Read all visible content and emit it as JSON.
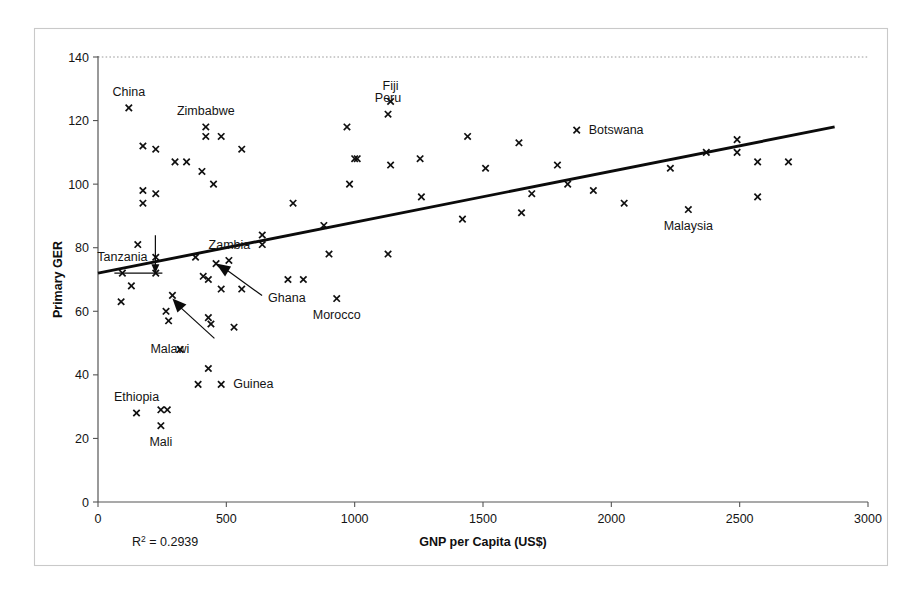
{
  "chart_data": {
    "type": "scatter",
    "title": "",
    "xlabel": "GNP per Capita (US$)",
    "ylabel": "Primary GER",
    "xlim": [
      0,
      3000
    ],
    "ylim": [
      0,
      140
    ],
    "xticks": [
      0,
      500,
      1000,
      1500,
      2000,
      2500,
      3000
    ],
    "yticks": [
      0,
      20,
      40,
      60,
      80,
      100,
      120,
      140
    ],
    "grid": false,
    "legend": null,
    "annotations": {
      "r2_prefix": "R",
      "r2_exponent": "2",
      "r2_value": " = 0.2939"
    },
    "trendline": {
      "type": "linear",
      "x_start": 0,
      "y_start": 72,
      "x_end": 2870,
      "y_end": 118
    },
    "marker_symbol": "x",
    "series": [
      {
        "name": "Countries",
        "points": [
          {
            "x": 120,
            "y": 124,
            "label": "China",
            "label_pos": "above"
          },
          {
            "x": 175,
            "y": 112,
            "label": "",
            "label_pos": ""
          },
          {
            "x": 225,
            "y": 111,
            "label": "",
            "label_pos": ""
          },
          {
            "x": 300,
            "y": 107,
            "label": "",
            "label_pos": ""
          },
          {
            "x": 345,
            "y": 107,
            "label": "",
            "label_pos": ""
          },
          {
            "x": 420,
            "y": 115,
            "label": "",
            "label_pos": ""
          },
          {
            "x": 480,
            "y": 115,
            "label": "",
            "label_pos": ""
          },
          {
            "x": 405,
            "y": 104,
            "label": "",
            "label_pos": ""
          },
          {
            "x": 450,
            "y": 100,
            "label": "",
            "label_pos": ""
          },
          {
            "x": 560,
            "y": 111,
            "label": "",
            "label_pos": ""
          },
          {
            "x": 175,
            "y": 98,
            "label": "",
            "label_pos": ""
          },
          {
            "x": 225,
            "y": 97,
            "label": "",
            "label_pos": ""
          },
          {
            "x": 175,
            "y": 94,
            "label": "",
            "label_pos": ""
          },
          {
            "x": 1140,
            "y": 126,
            "label": "Fiji",
            "label_pos": "above"
          },
          {
            "x": 1865,
            "y": 117,
            "label": "Botswana",
            "label_pos": "right"
          },
          {
            "x": 1130,
            "y": 122,
            "label": "Peru",
            "label_pos": "above"
          },
          {
            "x": 420,
            "y": 118,
            "label": "Zimbabwe",
            "label_pos": "above"
          },
          {
            "x": 970,
            "y": 118,
            "label": "",
            "label_pos": ""
          },
          {
            "x": 1440,
            "y": 115,
            "label": "",
            "label_pos": ""
          },
          {
            "x": 1640,
            "y": 113,
            "label": "",
            "label_pos": ""
          },
          {
            "x": 1000,
            "y": 108,
            "label": "",
            "label_pos": ""
          },
          {
            "x": 1010,
            "y": 108,
            "label": "",
            "label_pos": ""
          },
          {
            "x": 1140,
            "y": 106,
            "label": "",
            "label_pos": ""
          },
          {
            "x": 1255,
            "y": 108,
            "label": "",
            "label_pos": ""
          },
          {
            "x": 1510,
            "y": 105,
            "label": "",
            "label_pos": ""
          },
          {
            "x": 1790,
            "y": 106,
            "label": "",
            "label_pos": ""
          },
          {
            "x": 2230,
            "y": 105,
            "label": "",
            "label_pos": ""
          },
          {
            "x": 2370,
            "y": 110,
            "label": "",
            "label_pos": ""
          },
          {
            "x": 2490,
            "y": 114,
            "label": "",
            "label_pos": ""
          },
          {
            "x": 2490,
            "y": 110,
            "label": "",
            "label_pos": ""
          },
          {
            "x": 2570,
            "y": 107,
            "label": "",
            "label_pos": ""
          },
          {
            "x": 2690,
            "y": 107,
            "label": "",
            "label_pos": ""
          },
          {
            "x": 2570,
            "y": 96,
            "label": "",
            "label_pos": ""
          },
          {
            "x": 2300,
            "y": 92,
            "label": "Malaysia",
            "label_pos": "below"
          },
          {
            "x": 2050,
            "y": 94,
            "label": "",
            "label_pos": ""
          },
          {
            "x": 1930,
            "y": 98,
            "label": "",
            "label_pos": ""
          },
          {
            "x": 1830,
            "y": 100,
            "label": "",
            "label_pos": ""
          },
          {
            "x": 1690,
            "y": 97,
            "label": "",
            "label_pos": ""
          },
          {
            "x": 1650,
            "y": 91,
            "label": "",
            "label_pos": ""
          },
          {
            "x": 1420,
            "y": 89,
            "label": "",
            "label_pos": ""
          },
          {
            "x": 1260,
            "y": 96,
            "label": "",
            "label_pos": ""
          },
          {
            "x": 980,
            "y": 100,
            "label": "",
            "label_pos": ""
          },
          {
            "x": 760,
            "y": 94,
            "label": "",
            "label_pos": ""
          },
          {
            "x": 640,
            "y": 84,
            "label": "",
            "label_pos": ""
          },
          {
            "x": 880,
            "y": 87,
            "label": "",
            "label_pos": ""
          },
          {
            "x": 1130,
            "y": 78,
            "label": "",
            "label_pos": ""
          },
          {
            "x": 900,
            "y": 78,
            "label": "",
            "label_pos": ""
          },
          {
            "x": 640,
            "y": 81,
            "label": "Zambia",
            "label_pos": "left"
          },
          {
            "x": 155,
            "y": 81,
            "label": "",
            "label_pos": ""
          },
          {
            "x": 225,
            "y": 77,
            "label": "",
            "label_pos": ""
          },
          {
            "x": 380,
            "y": 77,
            "label": "",
            "label_pos": ""
          },
          {
            "x": 510,
            "y": 76,
            "label": "",
            "label_pos": ""
          },
          {
            "x": 95,
            "y": 72,
            "label": "Tanzania",
            "label_pos": "above"
          },
          {
            "x": 225,
            "y": 72,
            "label": "",
            "label_pos": ""
          },
          {
            "x": 410,
            "y": 71,
            "label": "",
            "label_pos": ""
          },
          {
            "x": 430,
            "y": 70,
            "label": "",
            "label_pos": ""
          },
          {
            "x": 460,
            "y": 75,
            "label": "Ghana",
            "label_pos": "arrow"
          },
          {
            "x": 740,
            "y": 70,
            "label": "",
            "label_pos": ""
          },
          {
            "x": 800,
            "y": 70,
            "label": "",
            "label_pos": ""
          },
          {
            "x": 130,
            "y": 68,
            "label": "",
            "label_pos": ""
          },
          {
            "x": 480,
            "y": 67,
            "label": "",
            "label_pos": ""
          },
          {
            "x": 560,
            "y": 67,
            "label": "",
            "label_pos": ""
          },
          {
            "x": 90,
            "y": 63,
            "label": "",
            "label_pos": ""
          },
          {
            "x": 290,
            "y": 65,
            "label": "Malawi",
            "label_pos": "arrow"
          },
          {
            "x": 265,
            "y": 60,
            "label": "",
            "label_pos": ""
          },
          {
            "x": 275,
            "y": 57,
            "label": "",
            "label_pos": ""
          },
          {
            "x": 430,
            "y": 58,
            "label": "",
            "label_pos": ""
          },
          {
            "x": 440,
            "y": 56,
            "label": "",
            "label_pos": ""
          },
          {
            "x": 530,
            "y": 55,
            "label": "",
            "label_pos": ""
          },
          {
            "x": 930,
            "y": 64,
            "label": "Morocco",
            "label_pos": "below"
          },
          {
            "x": 320,
            "y": 48,
            "label": "",
            "label_pos": ""
          },
          {
            "x": 430,
            "y": 42,
            "label": "",
            "label_pos": ""
          },
          {
            "x": 390,
            "y": 37,
            "label": "",
            "label_pos": ""
          },
          {
            "x": 480,
            "y": 37,
            "label": "Guinea",
            "label_pos": "right"
          },
          {
            "x": 150,
            "y": 28,
            "label": "Ethiopia",
            "label_pos": "above"
          },
          {
            "x": 270,
            "y": 29,
            "label": "",
            "label_pos": ""
          },
          {
            "x": 245,
            "y": 24,
            "label": "Mali",
            "label_pos": "below"
          },
          {
            "x": 245,
            "y": 29,
            "label": "",
            "label_pos": ""
          }
        ]
      }
    ]
  }
}
